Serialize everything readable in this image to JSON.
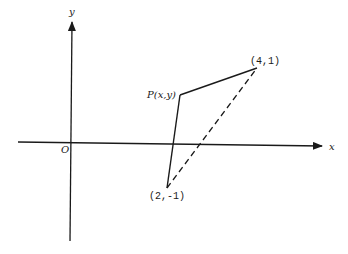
{
  "diagram": {
    "title": "",
    "axes": {
      "x_label": "x",
      "y_label": "y",
      "origin_label": "O"
    },
    "points": {
      "P": {
        "label": "P(x,y)",
        "name": "P"
      },
      "A": {
        "label": "(4,1)",
        "coords": [
          4,
          1
        ]
      },
      "B": {
        "label": "(2,-1)",
        "coords": [
          2,
          -1
        ]
      }
    },
    "segments": [
      {
        "from": "P",
        "to": "A",
        "style": "solid"
      },
      {
        "from": "P",
        "to": "B",
        "style": "solid"
      },
      {
        "from": "B",
        "to": "A",
        "style": "dashed"
      }
    ],
    "colors": {
      "ink": "#1a1a1a",
      "background": "#ffffff"
    }
  }
}
